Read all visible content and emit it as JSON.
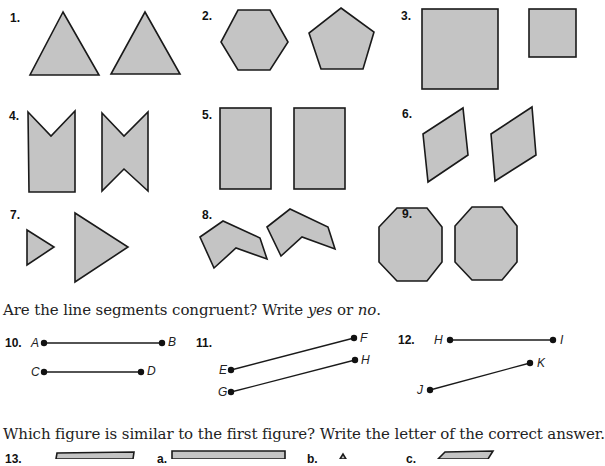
{
  "exercises": {
    "shape_items": [
      {
        "number": "1.",
        "shapes": [
          "triangle",
          "triangle"
        ]
      },
      {
        "number": "2.",
        "shapes": [
          "hexagon",
          "pentagon"
        ]
      },
      {
        "number": "3.",
        "shapes": [
          "large-square",
          "small-square"
        ]
      },
      {
        "number": "4.",
        "shapes": [
          "notched-rectangle",
          "bowtie-hexagon"
        ]
      },
      {
        "number": "5.",
        "shapes": [
          "rectangle",
          "rectangle"
        ]
      },
      {
        "number": "6.",
        "shapes": [
          "parallelogram",
          "parallelogram"
        ]
      },
      {
        "number": "7.",
        "shapes": [
          "small-triangle",
          "large-triangle"
        ]
      },
      {
        "number": "8.",
        "shapes": [
          "chevron",
          "chevron-rotated"
        ]
      },
      {
        "number": "9.",
        "shapes": [
          "octagon",
          "octagon"
        ]
      }
    ],
    "segments_instruction_pre": "Are the line segments congruent? Write ",
    "segments_instruction_yes": "yes",
    "segments_instruction_mid": " or ",
    "segments_instruction_no": "no",
    "segments_instruction_post": ".",
    "segment_items": [
      {
        "number": "10.",
        "segments": [
          [
            "A",
            "B"
          ],
          [
            "C",
            "D"
          ]
        ]
      },
      {
        "number": "11.",
        "segments": [
          [
            "E",
            "F"
          ],
          [
            "G",
            "H"
          ]
        ]
      },
      {
        "number": "12.",
        "segments": [
          [
            "H",
            "I"
          ],
          [
            "J",
            "K"
          ]
        ]
      }
    ],
    "similar_instruction": "Which figure is similar to the first figure? Write the letter of the correct answer.",
    "similar_item": {
      "number": "13.",
      "options": [
        "a.",
        "b.",
        "c."
      ]
    }
  }
}
